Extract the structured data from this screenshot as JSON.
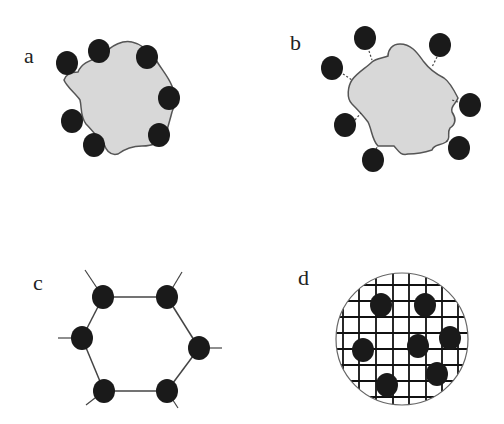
{
  "panels": [
    {
      "id": "a",
      "label": "a",
      "label_pos": [
        24,
        63
      ],
      "description": "Irregular gray particle with black spheres attached directly to its surface",
      "blob_path": "M78,72 C82,62 92,60 102,56 C112,44 124,40 132,42 C142,44 150,52 156,60 C162,70 168,76 172,86 C176,96 176,104 172,112 C170,120 168,126 166,134 C160,144 150,146 142,146 C134,146 126,148 118,154 C110,156 106,150 104,144 C98,138 92,130 86,124 C80,116 82,108 80,100 C76,94 66,86 64,80 C66,74 72,72 78,72 Z",
      "spheres": [
        [
          67,
          63
        ],
        [
          99,
          51
        ],
        [
          147,
          57
        ],
        [
          169,
          98
        ],
        [
          72,
          121
        ],
        [
          94,
          145
        ],
        [
          159,
          135
        ]
      ],
      "sphere_r": 11
    },
    {
      "id": "b",
      "label": "b",
      "label_pos": [
        290,
        50
      ],
      "description": "Irregular gray particle with black spheres tethered by short dashed linkers",
      "blob_path": "M372,62 C376,58 384,58 388,56 C388,50 392,44 400,44 C412,44 418,54 424,62 C430,70 436,74 444,78 C450,82 454,90 458,98 C456,104 450,106 452,112 C456,118 456,124 450,128 C446,134 452,138 446,142 C440,146 434,144 432,150 C426,152 416,154 408,154 C400,156 398,150 394,146 C388,146 382,146 378,146 C372,140 372,130 368,122 C362,114 356,108 352,104 C346,98 348,86 352,80 C358,72 366,68 372,62 Z",
      "spheres": [
        [
          365,
          38
        ],
        [
          332,
          68
        ],
        [
          440,
          45
        ],
        [
          470,
          105
        ],
        [
          345,
          125
        ],
        [
          373,
          160
        ],
        [
          459,
          148
        ]
      ],
      "linkers": [
        [
          [
            369,
            51
          ],
          [
            372,
            60
          ]
        ],
        [
          [
            343,
            74
          ],
          [
            352,
            80
          ]
        ],
        [
          [
            437,
            57
          ],
          [
            432,
            67
          ]
        ],
        [
          [
            458,
            102
          ],
          [
            452,
            100
          ]
        ],
        [
          [
            355,
            120
          ],
          [
            361,
            113
          ]
        ],
        [
          [
            376,
            149
          ],
          [
            378,
            146
          ]
        ],
        [
          [
            451,
            143
          ],
          [
            446,
            141
          ]
        ]
      ],
      "sphere_r": 11
    },
    {
      "id": "c",
      "label": "c",
      "label_pos": [
        33,
        290
      ],
      "description": "Hexagonal ring of black spheres connected by straight bonds with outward stubs",
      "ring": [
        [
          103,
          297
        ],
        [
          167,
          297
        ],
        [
          199,
          348
        ],
        [
          167,
          391
        ],
        [
          104,
          391
        ],
        [
          82,
          338
        ]
      ],
      "stubs": [
        [
          [
            103,
            297
          ],
          [
            85,
            270
          ]
        ],
        [
          [
            167,
            297
          ],
          [
            182,
            272
          ]
        ],
        [
          [
            199,
            348
          ],
          [
            222,
            348
          ]
        ],
        [
          [
            167,
            391
          ],
          [
            178,
            408
          ]
        ],
        [
          [
            104,
            391
          ],
          [
            86,
            405
          ]
        ],
        [
          [
            82,
            338
          ],
          [
            58,
            338
          ]
        ]
      ],
      "sphere_r": 11
    },
    {
      "id": "d",
      "label": "d",
      "label_pos": [
        298,
        285
      ],
      "description": "Circular cross-hatched matrix with embedded black spheres",
      "circle": {
        "cx": 402,
        "cy": 339,
        "r": 66
      },
      "grid_x": [
        343,
        359,
        376,
        393,
        409,
        426,
        442,
        458
      ],
      "grid_y": [
        285,
        301,
        317,
        333,
        349,
        365,
        381,
        397
      ],
      "spheres": [
        [
          381,
          305
        ],
        [
          425,
          305
        ],
        [
          363,
          350
        ],
        [
          418,
          346
        ],
        [
          450,
          338
        ],
        [
          437,
          374
        ],
        [
          387,
          385
        ]
      ],
      "sphere_r": 11
    }
  ],
  "colors": {
    "sphere": "#1a1a1a",
    "blob_fill": "#d8d8d8",
    "blob_stroke": "#555555",
    "line": "#444444",
    "background": "#ffffff"
  }
}
